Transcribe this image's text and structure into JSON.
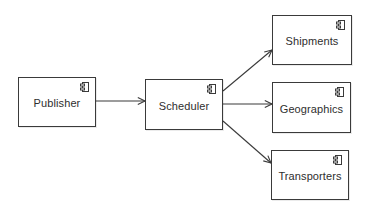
{
  "diagram": {
    "type": "component",
    "colors": {
      "stroke": "#3a3a3a",
      "text": "#2e2e2e",
      "background": "#ffffff"
    },
    "nodes": [
      {
        "id": "publisher",
        "label": "Publisher",
        "icon": "component-icon",
        "x": 18,
        "y": 77,
        "w": 78,
        "h": 50
      },
      {
        "id": "scheduler",
        "label": "Scheduler",
        "icon": "component-icon",
        "x": 145,
        "y": 79,
        "w": 78,
        "h": 51
      },
      {
        "id": "shipments",
        "label": "Shipments",
        "icon": "component-icon",
        "x": 272,
        "y": 15,
        "w": 80,
        "h": 50
      },
      {
        "id": "geographics",
        "label": "Geographics",
        "icon": "component-icon",
        "x": 272,
        "y": 82,
        "w": 79,
        "h": 51
      },
      {
        "id": "transporters",
        "label": "Transporters",
        "icon": "component-icon",
        "x": 271,
        "y": 150,
        "w": 78,
        "h": 50
      }
    ],
    "edges": [
      {
        "from": "publisher",
        "to": "shipments_placeholder_none",
        "x1": 96,
        "y1": 101,
        "x2": 145,
        "y2": 101,
        "source": "Publisher",
        "target": "Scheduler"
      },
      {
        "x1": 223,
        "y1": 91,
        "x2": 272,
        "y2": 50,
        "source": "Scheduler",
        "target": "Shipments"
      },
      {
        "x1": 223,
        "y1": 104,
        "x2": 272,
        "y2": 104,
        "source": "Scheduler",
        "target": "Geographics"
      },
      {
        "x1": 223,
        "y1": 121,
        "x2": 271,
        "y2": 163,
        "source": "Scheduler",
        "target": "Transporters"
      }
    ]
  }
}
